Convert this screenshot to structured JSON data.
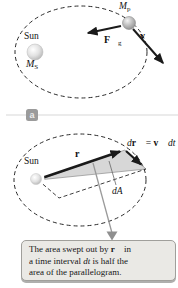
{
  "top_diagram": {
    "sun_label": "Sun",
    "sun_mass_main": "M",
    "sun_mass_sub": "S",
    "planet_main": "M",
    "planet_sub": "p",
    "force_main": "F⃗",
    "force_sub": "g",
    "velocity": "v⃗"
  },
  "divider": {
    "label": "a"
  },
  "bottom_diagram": {
    "sun_label": "Sun",
    "r_vector": "r⃗",
    "dr_d": "d",
    "dr_r": "r⃗",
    "dr_eq": " = ",
    "dr_v": "v⃗",
    "dr_dt": " dt",
    "area_label": "dA"
  },
  "caption": {
    "line1_pre": "The area swept out by ",
    "line1_vec": "r⃗",
    "line1_post": " in",
    "line2_pre": "a time interval ",
    "line2_italic": "dt",
    "line2_post": " is half the",
    "line3": "area of the parallelogram."
  },
  "colors": {
    "background": "#ffffff",
    "ink": "#1a1a1a",
    "shade_fill": "#d2d2d2",
    "leader_gray": "#9a9a9a",
    "caption_bg": "#eae9e5",
    "caption_border": "#a09f9b",
    "badge_bg": "#9b9b9b",
    "badge_text": "#ececec",
    "divider_line": "#d8d8d8"
  }
}
